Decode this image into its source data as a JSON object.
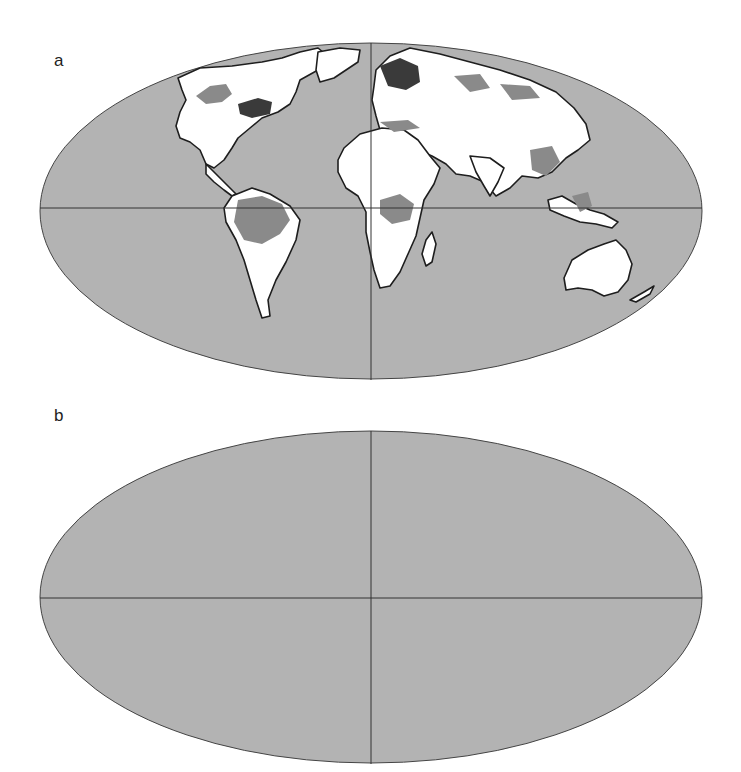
{
  "figure": {
    "projection": "Mollweide",
    "colors": {
      "background": "#ffffff",
      "ocean": "#b3b3b3",
      "land": "#ffffff",
      "outline": "#1e1e1e",
      "medium_shade": "#8a8a8a",
      "dark_shade": "#3a3a3a",
      "grid_line": "#333333"
    },
    "panels": [
      {
        "label": "a",
        "ellipse": {
          "cx": 371,
          "cy": 211,
          "rx": 331,
          "ry": 168
        },
        "equator_y": 208,
        "meridian_x": 371
      },
      {
        "label": "b",
        "ellipse": {
          "cx": 371,
          "cy": 563,
          "rx": 331,
          "ry": 166
        },
        "equator_y": 564,
        "meridian_x": 371
      }
    ],
    "shaded_regions": {
      "a": {
        "dark": [
          "eastern Canada / Great Lakes",
          "Scandinavia / western Russia"
        ],
        "medium": [
          "western & central Canada",
          "Amazon basin",
          "Congo basin",
          "Siberia",
          "Southeast China",
          "Borneo / Indonesia",
          "Mediterranean coast"
        ]
      },
      "b": {
        "dark": [
          "eastern Canada / Great Lakes",
          "Scandinavia / western Russia",
          "western Amazon / Andes",
          "Southeast Asia",
          "Indonesia",
          "Southeast China"
        ],
        "medium": [
          "western & central Canada",
          "Amazon basin",
          "Congo basin",
          "Siberia",
          "Borneo"
        ]
      }
    }
  }
}
